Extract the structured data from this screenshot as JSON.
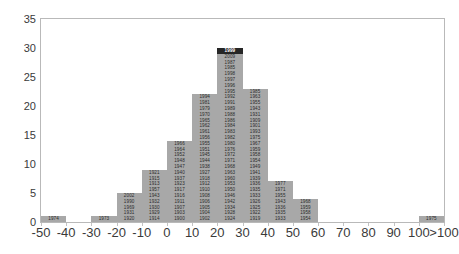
{
  "chart_data": {
    "type": "bar",
    "title": "",
    "subtitle": "",
    "xlabel": "",
    "ylabel": "",
    "grid": false,
    "legend": null,
    "xlim": [
      -50,
      110
    ],
    "ylim": [
      0,
      35
    ],
    "ytick_values": [
      0,
      5,
      10,
      15,
      20,
      25,
      30,
      35
    ],
    "ytick_labels": [
      "0",
      "5",
      "10",
      "15",
      "20",
      "25",
      "30",
      "35"
    ],
    "xtick_labels": [
      "-50",
      "-40",
      "-30",
      "-20",
      "-10",
      "0",
      "10",
      "20",
      "30",
      "40",
      "50",
      "60",
      "70",
      "80",
      "90",
      "100",
      ">100"
    ],
    "xtick_values": [
      -50,
      -40,
      -30,
      -20,
      -10,
      0,
      10,
      20,
      30,
      40,
      50,
      60,
      70,
      80,
      90,
      100,
      110
    ],
    "bin_width": 10,
    "bar_color": "#a8a8a8",
    "highlight_color": "#262626",
    "highlight_label": "1999",
    "categories": [
      "-50 to -40",
      "-40 to -30",
      "-30 to -20",
      "-20 to -10",
      "-10 to 0",
      "0 to 10",
      "10 to 20",
      "20 to 30",
      "30 to 40",
      "40 to 50",
      "50 to 60",
      "60 to 70",
      "70 to 80",
      "80 to 90",
      "90 to 100",
      ">100"
    ],
    "values": [
      1,
      0,
      1,
      5,
      9,
      14,
      22,
      30,
      23,
      7,
      4,
      0,
      0,
      0,
      0,
      1
    ],
    "bins": [
      {
        "bin_start": -50,
        "bin_end": -40,
        "count": 1,
        "labels": [
          "1974"
        ]
      },
      {
        "bin_start": -40,
        "bin_end": -30,
        "count": 0,
        "labels": []
      },
      {
        "bin_start": -30,
        "bin_end": -20,
        "count": 1,
        "labels": [
          "1973"
        ]
      },
      {
        "bin_start": -20,
        "bin_end": -10,
        "count": 5,
        "labels": [
          "1920",
          "1929",
          "1930",
          "1931",
          "1969",
          "1990",
          "2002",
          "2001",
          "2008"
        ]
      },
      {
        "bin_start": -10,
        "bin_end": 0,
        "count": 9,
        "labels": [
          "1914",
          "1930",
          "1932",
          "1940",
          "1957",
          "1966",
          "1977",
          "1913",
          "1915",
          "1921"
        ]
      },
      {
        "bin_start": 0,
        "bin_end": 10,
        "count": 14,
        "labels": [
          "1900",
          "1903",
          "1907",
          "1911",
          "1916",
          "1917",
          "1918",
          "1923",
          "1934",
          "1939",
          "1947",
          "1948",
          "1952",
          "1960",
          "1909",
          "1910",
          "1912"
        ]
      },
      {
        "bin_start": 10,
        "bin_end": 20,
        "count": 22,
        "labels": [
          "1902",
          "1904",
          "1905",
          "1906",
          "1908",
          "1919",
          "1926",
          "1927",
          "1944",
          "1945",
          "1951",
          "1955",
          "1956",
          "1959",
          "1961",
          "1962",
          "1965",
          "1970",
          "1985",
          "1987",
          "1988",
          "1991",
          "1992",
          "1998"
        ]
      },
      {
        "bin_start": 20,
        "bin_end": 30,
        "count": 30,
        "labels": [
          "1924",
          "1928",
          "1936",
          "1935",
          "1938",
          "1942",
          "1943",
          "1946",
          "1950",
          "1963",
          "1964",
          "1967",
          "1971",
          "1972",
          "1976",
          "1980",
          "1982",
          "1983",
          "1984",
          "1986",
          "1989",
          "1995",
          "1996",
          "1997",
          "1999"
        ]
      },
      {
        "bin_start": 30,
        "bin_end": 40,
        "count": 23,
        "labels": [
          "1919",
          "1922",
          "1925",
          "1927",
          "1933",
          "1937",
          "1941",
          "1949",
          "1953",
          "1954",
          "1958",
          "1968",
          "1975",
          "1979",
          "1993",
          "1994"
        ]
      },
      {
        "bin_start": 40,
        "bin_end": 50,
        "count": 7,
        "labels": [
          "1933",
          "1954",
          "1958",
          "1967",
          "1977"
        ]
      },
      {
        "bin_start": 50,
        "bin_end": 60,
        "count": 4,
        "labels": [
          "1954",
          "1959",
          "1968"
        ]
      },
      {
        "bin_start": 60,
        "bin_end": 70,
        "count": 0,
        "labels": []
      },
      {
        "bin_start": 70,
        "bin_end": 80,
        "count": 0,
        "labels": []
      },
      {
        "bin_start": 80,
        "bin_end": 90,
        "count": 0,
        "labels": []
      },
      {
        "bin_start": 90,
        "bin_end": 100,
        "count": 0,
        "labels": []
      },
      {
        "bin_start": 100,
        "bin_end": 110,
        "count": 1,
        "labels": [
          "1975"
        ]
      }
    ],
    "bar_cells": [
      {
        "bin_index": 0,
        "count": 1,
        "labels": [
          "1974"
        ]
      },
      {
        "bin_index": 2,
        "count": 1,
        "labels": [
          "1973"
        ]
      },
      {
        "bin_index": 3,
        "count": 5,
        "labels": [
          "1920",
          "1931",
          "1969",
          "1990",
          "2002"
        ]
      },
      {
        "bin_index": 4,
        "count": 9,
        "labels": [
          "1914",
          "1929",
          "1930",
          "1932",
          "1943",
          "1957",
          "1913",
          "1915",
          "1921"
        ]
      },
      {
        "bin_index": 5,
        "count": 14,
        "labels": [
          "1900",
          "1903",
          "1907",
          "1911",
          "1916",
          "1917",
          "1923",
          "1937",
          "1940",
          "1947",
          "1948",
          "1952",
          "1964",
          "1966"
        ]
      },
      {
        "bin_index": 6,
        "count": 22,
        "labels": [
          "1902",
          "1904",
          "1905",
          "1906",
          "1908",
          "1910",
          "1912",
          "1918",
          "1927",
          "1938",
          "1944",
          "1945",
          "1951",
          "1955",
          "1956",
          "1961",
          "1962",
          "1965",
          "1970",
          "1979",
          "1981",
          "1994"
        ]
      },
      {
        "bin_index": 7,
        "count": 30,
        "labels": [
          "1924",
          "1928",
          "1934",
          "1942",
          "1946",
          "1950",
          "1953",
          "1960",
          "1963",
          "1968",
          "1971",
          "1972",
          "1976",
          "1980",
          "1982",
          "1983",
          "1984",
          "1986",
          "1988",
          "1989",
          "1991",
          "1992",
          "1995",
          "1996",
          "1997",
          "1998",
          "1985",
          "1987",
          "2009",
          "1999"
        ]
      },
      {
        "bin_index": 8,
        "count": 23,
        "labels": [
          "1919",
          "1922",
          "1925",
          "1926",
          "1933",
          "1935",
          "1936",
          "1939",
          "1941",
          "1949",
          "1954",
          "1958",
          "1959",
          "1967",
          "1975",
          "1993",
          "1901",
          "1909",
          "1931",
          "1943",
          "1955",
          "1963",
          "1985"
        ]
      },
      {
        "bin_index": 9,
        "count": 7,
        "labels": [
          "1933",
          "1935",
          "1936",
          "1943",
          "1955",
          "1971",
          "1977"
        ]
      },
      {
        "bin_index": 10,
        "count": 4,
        "labels": [
          "1954",
          "1958",
          "1959",
          "1968"
        ]
      },
      {
        "bin_index": 15,
        "count": 1,
        "labels": [
          "1975"
        ]
      }
    ]
  }
}
